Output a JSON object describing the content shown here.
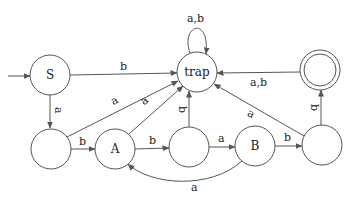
{
  "diagram": {
    "type": "finite-automaton",
    "states": [
      {
        "id": "S",
        "label": "S",
        "initial": true
      },
      {
        "id": "trap",
        "label": "trap"
      },
      {
        "id": "accept",
        "label": "",
        "accepting": true
      },
      {
        "id": "q1",
        "label": ""
      },
      {
        "id": "A",
        "label": "A"
      },
      {
        "id": "q3",
        "label": ""
      },
      {
        "id": "B",
        "label": "B"
      },
      {
        "id": "q5",
        "label": ""
      }
    ],
    "transitions": [
      {
        "from": "S",
        "to": "trap",
        "label": "b"
      },
      {
        "from": "S",
        "to": "q1",
        "label": "a"
      },
      {
        "from": "trap",
        "to": "trap",
        "label": "a,b"
      },
      {
        "from": "accept",
        "to": "trap",
        "label": "a,b"
      },
      {
        "from": "q1",
        "to": "trap",
        "label": "a"
      },
      {
        "from": "q1",
        "to": "A",
        "label": "b"
      },
      {
        "from": "A",
        "to": "trap",
        "label": "a"
      },
      {
        "from": "A",
        "to": "q3",
        "label": "b"
      },
      {
        "from": "q3",
        "to": "trap",
        "label": "b"
      },
      {
        "from": "q3",
        "to": "B",
        "label": "a"
      },
      {
        "from": "B",
        "to": "A",
        "label": "a"
      },
      {
        "from": "B",
        "to": "q5",
        "label": "b"
      },
      {
        "from": "q5",
        "to": "trap",
        "label": "a"
      },
      {
        "from": "q5",
        "to": "accept",
        "label": "b"
      }
    ]
  }
}
